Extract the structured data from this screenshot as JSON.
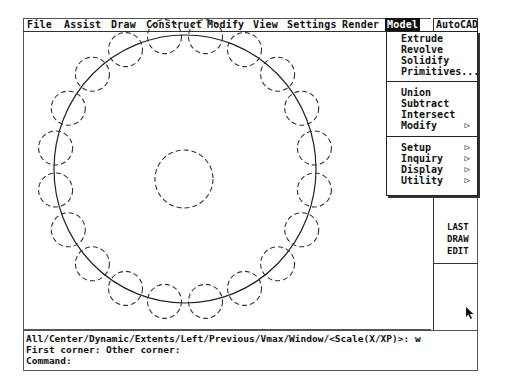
{
  "menubar": {
    "items": [
      "File",
      "Assist",
      "Draw",
      "Construct",
      "Modify",
      "View",
      "Settings",
      "Render",
      "Model"
    ],
    "active": "Model",
    "autocad_tab": "AutoCAD"
  },
  "model_menu": {
    "groups": [
      [
        {
          "label": "Extrude",
          "submenu": false
        },
        {
          "label": "Revolve",
          "submenu": false
        },
        {
          "label": "Solidify",
          "submenu": false
        },
        {
          "label": "Primitives...",
          "submenu": false
        }
      ],
      [
        {
          "label": "Union",
          "submenu": false
        },
        {
          "label": "Subtract",
          "submenu": false
        },
        {
          "label": "Intersect",
          "submenu": false
        },
        {
          "label": "Modify",
          "submenu": true
        }
      ],
      [
        {
          "label": "Setup",
          "submenu": true
        },
        {
          "label": "Inquiry",
          "submenu": true
        },
        {
          "label": "Display",
          "submenu": true
        },
        {
          "label": "Utility",
          "submenu": true
        }
      ]
    ],
    "submenu_arrow": "▷"
  },
  "screen_menu": {
    "items": [
      "LAST",
      "DRAW",
      "EDIT"
    ]
  },
  "command_area": {
    "lines": [
      "All/Center/Dynamic/Extents/Left/Previous/Vmax/Window/<Scale(X/XP)>: w",
      "First corner: Other corner:",
      "Command:"
    ]
  },
  "drawing": {
    "large_circle": {
      "cx": 185,
      "cy": 169,
      "rx": 131,
      "ry": 134
    },
    "center_circle": {
      "cx": 184,
      "cy": 179,
      "r": 29
    },
    "ring_circle_count": 20,
    "ring_circle_radius": 17
  }
}
